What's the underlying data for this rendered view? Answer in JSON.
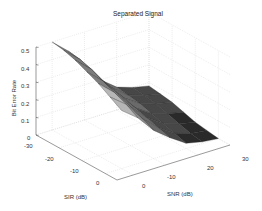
{
  "chart_data": {
    "type": "surface",
    "title": "Separated Signal",
    "xlabel": "SIR (dB)",
    "ylabel": "SNR (dB)",
    "zlabel": "Bit Error Rate",
    "x_ticks": [
      -30,
      -20,
      -10,
      0
    ],
    "y_ticks": [
      0,
      10,
      20,
      30
    ],
    "z_ticks": [
      0,
      0.1,
      0.2,
      0.3,
      0.4,
      0.5
    ],
    "xlim": [
      -30,
      5
    ],
    "ylim": [
      -5,
      30
    ],
    "zlim": [
      0,
      0.5
    ],
    "x": [
      -30,
      -25,
      -20,
      -15,
      -10,
      -5,
      0
    ],
    "y": [
      0,
      5,
      10,
      15,
      20,
      25,
      30
    ],
    "z": [
      [
        0.5,
        0.49,
        0.47,
        0.44,
        0.41,
        0.37,
        0.33
      ],
      [
        0.42,
        0.41,
        0.39,
        0.36,
        0.33,
        0.3,
        0.26
      ],
      [
        0.3,
        0.29,
        0.27,
        0.25,
        0.22,
        0.19,
        0.16
      ],
      [
        0.2,
        0.19,
        0.17,
        0.15,
        0.13,
        0.11,
        0.09
      ],
      [
        0.13,
        0.12,
        0.11,
        0.09,
        0.07,
        0.05,
        0.03
      ],
      [
        0.1,
        0.09,
        0.08,
        0.06,
        0.04,
        0.02,
        0.01
      ],
      [
        0.08,
        0.07,
        0.06,
        0.04,
        0.02,
        0.01,
        0.0
      ]
    ],
    "grid": true,
    "colormap": "gray"
  },
  "labels": {
    "title": "Separated Signal",
    "zlabel": "Bit Error Rate",
    "xlabel": "SIR (dB)",
    "ylabel": "SNR (dB)",
    "z_tick_labels": [
      "0",
      "0.1",
      "0.2",
      "0.3",
      "0.4",
      "0.5"
    ],
    "x_tick_labels": [
      "-30",
      "-20",
      "-10",
      "0"
    ],
    "y_tick_labels": [
      "0",
      "-10",
      "20",
      "30"
    ]
  }
}
